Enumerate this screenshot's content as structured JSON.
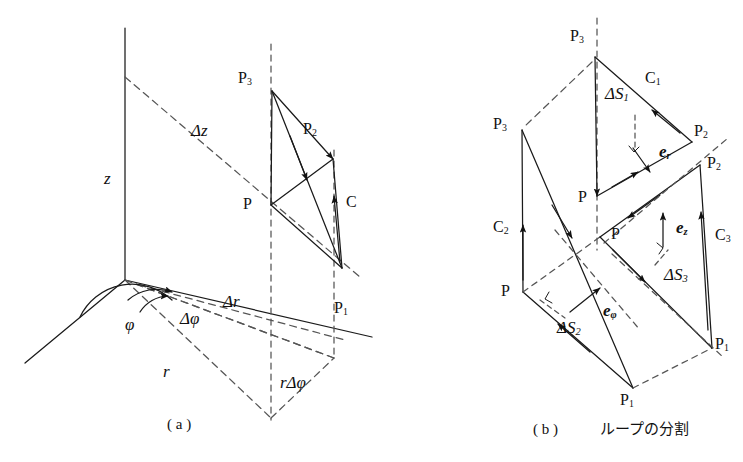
{
  "figure": {
    "colors": {
      "ink": "#1a1a1a",
      "dash": "#555555",
      "background": "#ffffff"
    },
    "panels": [
      {
        "id": "a",
        "caption_label": "( a )",
        "caption_text": "",
        "axis_labels": {
          "z": "z",
          "r": "r",
          "phi": "φ"
        },
        "quantities": [
          {
            "name": "delta-z",
            "text": "Δz"
          },
          {
            "name": "delta-r",
            "text": "Δr"
          },
          {
            "name": "delta-phi",
            "text": "Δφ"
          },
          {
            "name": "r-delta-phi",
            "text": "rΔφ"
          }
        ],
        "points": [
          {
            "name": "P",
            "base": "P",
            "sub": ""
          },
          {
            "name": "P1",
            "base": "P",
            "sub": "1"
          },
          {
            "name": "P2",
            "base": "P",
            "sub": "2"
          },
          {
            "name": "P3",
            "base": "P",
            "sub": "3"
          }
        ],
        "curves": [
          {
            "name": "C",
            "base": "C",
            "sub": ""
          }
        ]
      },
      {
        "id": "b",
        "caption_label": "( b )",
        "caption_text": "ループの分割",
        "areas": [
          {
            "name": "delta-S1",
            "base": "ΔS",
            "sub": "1"
          },
          {
            "name": "delta-S2",
            "base": "ΔS",
            "sub": "2"
          },
          {
            "name": "delta-S3",
            "base": "ΔS",
            "sub": "3"
          }
        ],
        "curves": [
          {
            "name": "C1",
            "base": "C",
            "sub": "1"
          },
          {
            "name": "C2",
            "base": "C",
            "sub": "2"
          },
          {
            "name": "C3",
            "base": "C",
            "sub": "3"
          }
        ],
        "unit_vectors": [
          {
            "name": "e-r",
            "base": "e",
            "sub": "r"
          },
          {
            "name": "e-z",
            "base": "e",
            "sub": "z"
          },
          {
            "name": "e-phi",
            "base": "e",
            "sub": "φ"
          }
        ],
        "points": [
          {
            "name": "P",
            "base": "P",
            "sub": ""
          },
          {
            "name": "P1",
            "base": "P",
            "sub": "1"
          },
          {
            "name": "P2",
            "base": "P",
            "sub": "2"
          },
          {
            "name": "P3",
            "base": "P",
            "sub": "3"
          }
        ]
      }
    ]
  }
}
